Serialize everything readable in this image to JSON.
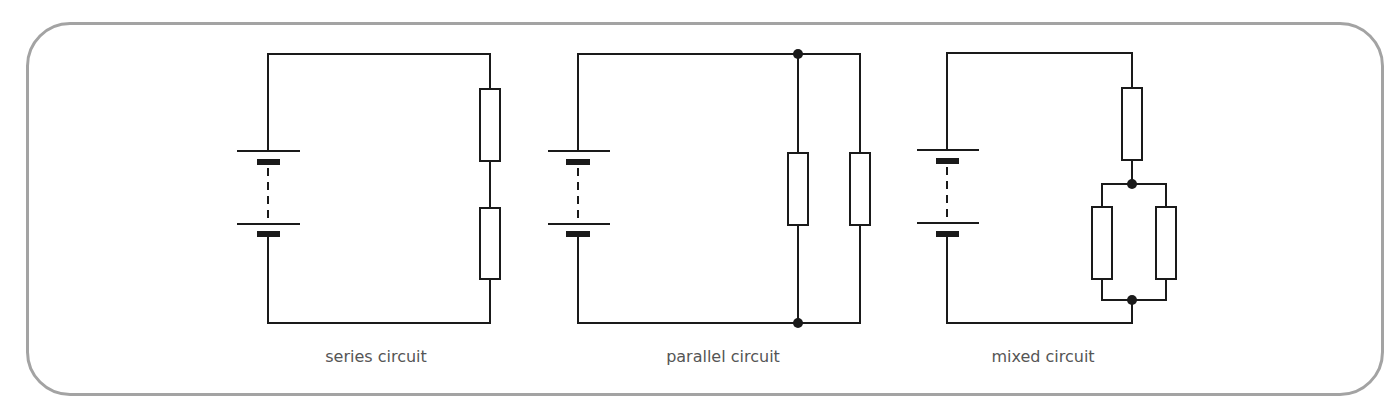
{
  "figure": {
    "panels": [
      {
        "id": "series",
        "label": "series circuit",
        "components": [
          "cell-battery",
          "resistor",
          "resistor"
        ]
      },
      {
        "id": "parallel",
        "label": "parallel circuit",
        "components": [
          "cell-battery",
          "resistor",
          "resistor"
        ],
        "junctions": 2
      },
      {
        "id": "mixed",
        "label": "mixed circuit",
        "components": [
          "cell-battery",
          "resistor",
          "resistor",
          "resistor"
        ],
        "junctions": 2
      }
    ]
  },
  "colors": {
    "border": "#a3a3a3",
    "line": "#1a1a1a",
    "label": "#555555"
  }
}
